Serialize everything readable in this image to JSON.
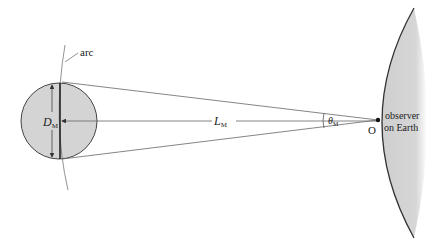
{
  "diagram": {
    "labels": {
      "arc": "arc",
      "diameter_symbol": "D",
      "diameter_subscript": "M",
      "distance_symbol": "L",
      "distance_subscript": "M",
      "angle_symbol": "θ",
      "angle_subscript": "M",
      "observer_point": "O",
      "observer_line1": "observer",
      "observer_line2": "on Earth"
    },
    "colors": {
      "moon_fill": "#d4d4d4",
      "earth_fill": "#d0d0d0",
      "stroke": "#333333",
      "thin_line": "#666666"
    }
  }
}
